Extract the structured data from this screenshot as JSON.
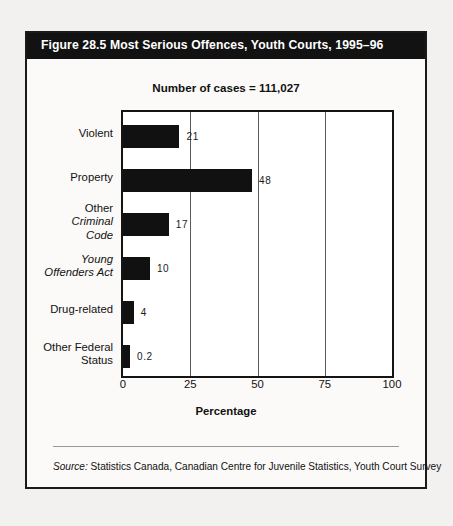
{
  "figure": {
    "title": "Figure 28.5  Most Serious Offences, Youth Courts, 1995–96",
    "subtitle": "Number of cases = 111,027",
    "source_prefix": "Source:",
    "source_text": " Statistics Canada, Canadian Centre for Juvenile Statistics, Youth Court Survey"
  },
  "chart_data": {
    "type": "bar",
    "orientation": "horizontal",
    "title": "Figure 28.5  Most Serious Offences, Youth Courts, 1995–96",
    "subtitle": "Number of cases = 111,027",
    "xlabel": "Percentage",
    "ylabel": "",
    "xlim": [
      0,
      100
    ],
    "xticks": [
      0,
      25,
      50,
      75,
      100
    ],
    "xtick_labels": [
      "0",
      "25",
      "50",
      "75",
      "100"
    ],
    "grid": true,
    "grid_axis": "x",
    "legend": false,
    "bar_color": "#111111",
    "categories": [
      "Violent",
      "Property",
      "Other Criminal Code",
      "Young Offenders Act",
      "Drug-related",
      "Other Federal Status"
    ],
    "values": [
      21,
      48,
      17,
      10,
      4,
      0.2
    ],
    "data_labels": [
      "21",
      "48",
      "17",
      "10",
      "4",
      "0.2"
    ],
    "categories_display": [
      {
        "lines": [
          {
            "text": "Violent",
            "italic": false
          }
        ]
      },
      {
        "lines": [
          {
            "text": "Property",
            "italic": false
          }
        ]
      },
      {
        "lines": [
          {
            "text": "Other",
            "italic": false
          },
          {
            "text": "Criminal",
            "italic": true
          },
          {
            "text": "Code",
            "italic": true
          }
        ]
      },
      {
        "lines": [
          {
            "text": "Young",
            "italic": true
          },
          {
            "text": "Offenders Act",
            "italic": true
          }
        ]
      },
      {
        "lines": [
          {
            "text": "Drug-related",
            "italic": false
          }
        ]
      },
      {
        "lines": [
          {
            "text": "Other Federal",
            "italic": false
          },
          {
            "text": "Status",
            "italic": false
          }
        ]
      }
    ]
  }
}
